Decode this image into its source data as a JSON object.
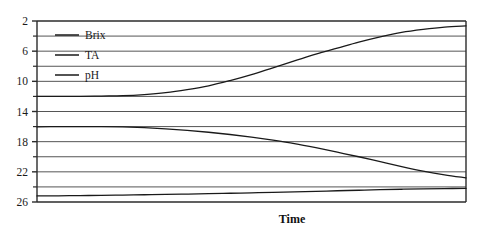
{
  "figure": {
    "background_color": "#ffffff",
    "ink_color": "#1a1a1a",
    "grid_color": "#555555",
    "frame_color": "#2b2b2b"
  },
  "axis": {
    "x_title": "Time",
    "y_tick_labels": [
      "26",
      "22",
      "18",
      "14",
      "10",
      "6",
      "2"
    ]
  },
  "legend": {
    "entries": [
      {
        "label": "Brix"
      },
      {
        "label": "TA"
      },
      {
        "label": "pH"
      }
    ]
  },
  "chart_data": {
    "type": "line",
    "title": "",
    "subtitle": "",
    "xlabel": "Time",
    "ylabel": "",
    "xlim": [
      0,
      100
    ],
    "ylim": [
      2,
      26
    ],
    "y_major_ticks": [
      2,
      6,
      10,
      14,
      18,
      22,
      26
    ],
    "y_minor_ticks": [
      4,
      8,
      12,
      16,
      20,
      24
    ],
    "grid": "horizontal-every-2-units",
    "legend_position": "inside-upper-left",
    "x_tick_labels": [],
    "x": [
      0,
      5,
      10,
      15,
      20,
      25,
      30,
      35,
      40,
      45,
      50,
      55,
      60,
      65,
      70,
      75,
      80,
      85,
      90,
      95,
      100
    ],
    "series": [
      {
        "name": "Brix",
        "color": "#1a1a1a",
        "values": [
          16.0,
          16.0,
          16.0,
          16.05,
          16.1,
          16.25,
          16.5,
          16.9,
          17.4,
          18.1,
          18.9,
          19.8,
          20.7,
          21.6,
          22.4,
          23.2,
          23.9,
          24.5,
          24.9,
          25.2,
          25.35
        ]
      },
      {
        "name": "TA",
        "color": "#1a1a1a",
        "values": [
          11.95,
          12.0,
          12.0,
          12.0,
          11.95,
          11.85,
          11.7,
          11.5,
          11.25,
          10.95,
          10.6,
          10.2,
          9.75,
          9.2,
          8.6,
          8.0,
          7.35,
          6.7,
          6.1,
          5.6,
          5.2
        ]
      },
      {
        "name": "pH",
        "color": "#1a1a1a",
        "values": [
          2.8,
          2.82,
          2.85,
          2.88,
          2.92,
          2.96,
          3.0,
          3.05,
          3.1,
          3.16,
          3.22,
          3.28,
          3.35,
          3.42,
          3.49,
          3.56,
          3.63,
          3.69,
          3.74,
          3.78,
          3.8
        ]
      }
    ]
  }
}
